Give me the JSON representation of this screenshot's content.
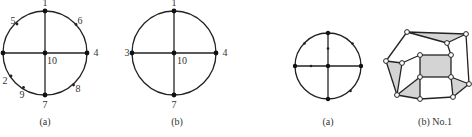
{
  "figures": [
    {
      "id": "left-a",
      "caption": "(a)",
      "circle": {
        "cx": 45,
        "cy": 53,
        "r": 42
      },
      "labels": [
        {
          "text": "1",
          "x": 45,
          "y": 6
        },
        {
          "text": "5",
          "x": 13,
          "y": 24
        },
        {
          "text": "6",
          "x": 80,
          "y": 24
        },
        {
          "text": "4",
          "x": 96,
          "y": 56
        },
        {
          "text": "10",
          "x": 52,
          "y": 64
        },
        {
          "text": "2",
          "x": 5,
          "y": 84
        },
        {
          "text": "9",
          "x": 22,
          "y": 98
        },
        {
          "text": "8",
          "x": 78,
          "y": 92
        },
        {
          "text": "7",
          "x": 45,
          "y": 108
        }
      ]
    },
    {
      "id": "left-b",
      "caption": "(b)",
      "circle": {
        "cx": 174,
        "cy": 53,
        "r": 42
      },
      "labels": [
        {
          "text": "1",
          "x": 174,
          "y": 6
        },
        {
          "text": "3",
          "x": 127,
          "y": 56
        },
        {
          "text": "4",
          "x": 225,
          "y": 56
        },
        {
          "text": "10",
          "x": 182,
          "y": 64
        },
        {
          "text": "7",
          "x": 174,
          "y": 108
        }
      ]
    },
    {
      "id": "right-a",
      "caption": "(a)",
      "circle": {
        "cx": 328,
        "cy": 66,
        "r": 33
      }
    },
    {
      "id": "right-b",
      "caption": "(b) No.1"
    }
  ]
}
